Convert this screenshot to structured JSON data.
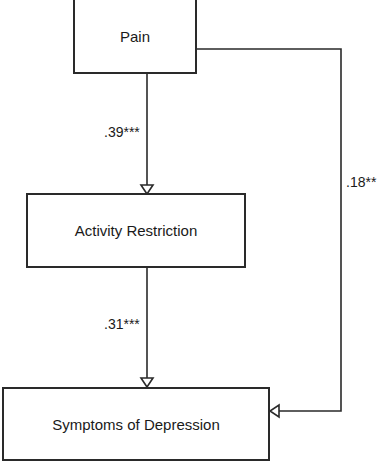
{
  "diagram": {
    "type": "path-model",
    "nodes": [
      {
        "id": "pain",
        "label": "Pain"
      },
      {
        "id": "activity",
        "label": "Activity Restriction"
      },
      {
        "id": "depression",
        "label": "Symptoms of Depression"
      }
    ],
    "edges": [
      {
        "from": "pain",
        "to": "activity",
        "label": ".39***"
      },
      {
        "from": "activity",
        "to": "depression",
        "label": ".31***"
      },
      {
        "from": "pain",
        "to": "depression",
        "label": ".18**"
      }
    ]
  }
}
